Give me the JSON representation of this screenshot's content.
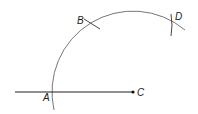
{
  "diagram": {
    "type": "geometric-construction",
    "points": {
      "A": {
        "label": "A"
      },
      "B": {
        "label": "B"
      },
      "C": {
        "label": "C"
      },
      "D": {
        "label": "D"
      }
    },
    "colors": {
      "line": "#222222",
      "arc": "#777777",
      "background": "#ffffff"
    }
  }
}
